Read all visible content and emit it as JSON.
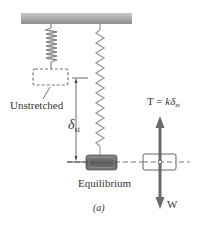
{
  "figure": {
    "caption": "(a)",
    "labels": {
      "unstretched": "Unstretched",
      "equilibrium": "Equilibrium",
      "deflection_symbol": "δ",
      "deflection_subscript": "st",
      "tension_lhs": "T",
      "tension_eq": " = ",
      "tension_k": "k",
      "tension_delta": "δ",
      "tension_subscript": "st",
      "weight": "W"
    },
    "colors": {
      "ceiling": "#a9a9a9",
      "spring": "#8a8a8a",
      "block": "#6f6f6f",
      "arrow": "#6b6b6b",
      "line": "#444444"
    }
  }
}
